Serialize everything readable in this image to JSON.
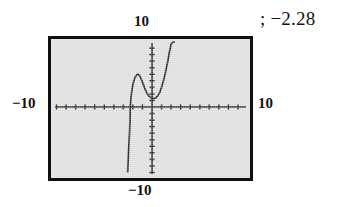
{
  "figure": {
    "edge_fragment": ")",
    "answer_text": "; −2.28"
  },
  "calculator": {
    "window_labels": {
      "top": "10",
      "bottom": "−10",
      "left": "−10",
      "right": "10"
    }
  },
  "chart_data": {
    "type": "line",
    "title": "",
    "subtitle": "",
    "xlabel": "",
    "ylabel": "",
    "xlim": [
      -10,
      10
    ],
    "ylim": [
      -10,
      10
    ],
    "xtick_interval": 1,
    "ytick_interval": 1,
    "grid": false,
    "legend": null,
    "axis_style": "tick-marked crosshair axes, no gridlines",
    "tick_labels": {
      "x": [
        "-10",
        "10"
      ],
      "y": [
        "-10",
        "10"
      ]
    },
    "annotations": [
      "; −2.28"
    ],
    "series": [
      {
        "name": "graphed function",
        "description": "quartic-like curve: steep rise from below the window, local maximum left of the y-axis, local minimum right of the y-axis, then steep rise out the top",
        "x": [
          -2.55,
          -2.5,
          -2.45,
          -2.4,
          -2.35,
          -2.3,
          -2.28,
          -2.2,
          -2.1,
          -2.0,
          -1.9,
          -1.8,
          -1.7,
          -1.6,
          -1.5,
          -1.4,
          -1.3,
          -1.2,
          -1.0,
          -0.8,
          -0.6,
          -0.4,
          -0.2,
          0.0,
          0.2,
          0.4,
          0.6,
          0.8,
          1.0,
          1.2,
          1.4,
          1.6,
          1.8,
          2.0,
          2.2,
          2.4
        ],
        "y": [
          -10.0,
          -8.2,
          -6.6,
          -5.2,
          -3.9,
          -2.0,
          0.0,
          1.4,
          2.6,
          3.4,
          4.0,
          4.4,
          4.7,
          4.9,
          5.0,
          4.95,
          4.8,
          4.5,
          3.8,
          3.0,
          2.3,
          1.8,
          1.5,
          1.35,
          1.3,
          1.4,
          1.7,
          2.2,
          3.0,
          4.0,
          5.2,
          6.6,
          8.2,
          9.6,
          10.0,
          10.0
        ]
      }
    ],
    "key_points": {
      "x_intercept": -2.28,
      "local_maximum_x": -1.5,
      "local_minimum_x": 0.25
    }
  }
}
